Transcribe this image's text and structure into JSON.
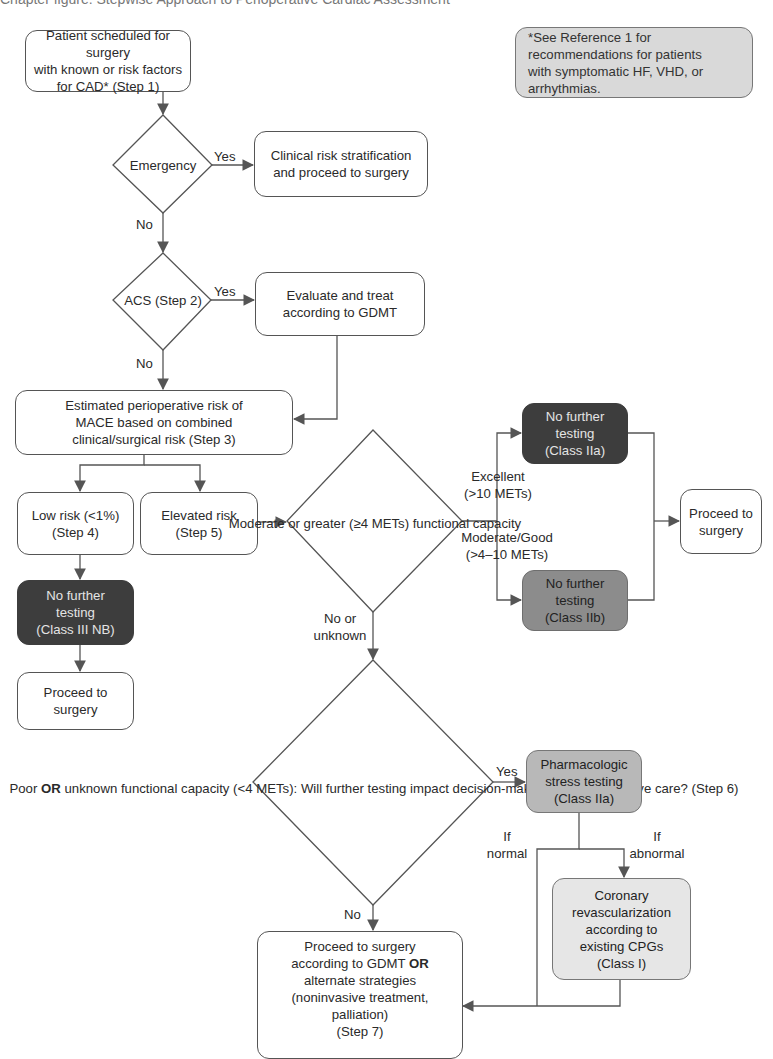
{
  "header_clip": "Chapter figure: Stepwise Approach to Perioperative Cardiac Assessment",
  "note": {
    "lines": [
      "*See Reference 1 for",
      "recommendations for patients",
      "with symptomatic HF, VHD, or",
      "arrhythmias."
    ]
  },
  "nodes": {
    "step1": [
      "Patient scheduled for surgery",
      "with known or risk factors",
      "for CAD* (Step 1)"
    ],
    "emergency": [
      "Emergency"
    ],
    "clinical": [
      "Clinical risk stratification",
      "and proceed to surgery"
    ],
    "acs": [
      "ACS",
      "(Step 2)"
    ],
    "evaluate": [
      "Evaluate and treat",
      "according to GDMT"
    ],
    "mace": [
      "Estimated perioperative risk of",
      "MACE based on combined",
      "clinical/surgical risk (Step 3)"
    ],
    "low_risk": [
      "Low risk (<1%)",
      "(Step 4)"
    ],
    "elevated": [
      "Elevated risk",
      "(Step 5)"
    ],
    "no_further_iii": [
      "No further",
      "testing",
      "(Class III NB)"
    ],
    "proceed_left": [
      "Proceed to",
      "surgery"
    ],
    "moderate": [
      "Moderate or greater",
      "(≥4 METs) functional",
      "capacity"
    ],
    "no_further_iia": [
      "No further",
      "testing",
      "(Class IIa)"
    ],
    "no_further_iib": [
      "No further",
      "testing",
      "(Class IIb)"
    ],
    "proceed_right": [
      "Proceed to",
      "surgery"
    ],
    "step6": [
      "Poor ",
      "OR",
      " unknown",
      "functional capacity",
      "(<4 METs):",
      "Will further testing impact",
      "decision-making ",
      "OR",
      "perioperative care?",
      "(Step 6)"
    ],
    "pharm": [
      "Pharmacologic",
      "stress testing",
      "(Class IIa)"
    ],
    "coronary": [
      "Coronary",
      "revascularization",
      "according to",
      "existing CPGs",
      "(Class I)"
    ],
    "step7": [
      "Proceed to surgery",
      "according to GDMT ",
      "OR",
      "alternate strategies",
      "(noninvasive treatment,",
      "palliation)",
      "(Step 7)"
    ]
  },
  "labels": {
    "emergency_yes": "Yes",
    "emergency_no": "No",
    "acs_yes": "Yes",
    "acs_no": "No",
    "excellent": [
      "Excellent",
      "(>10 METs)"
    ],
    "moderate_good": [
      "Moderate/Good",
      "(>4–10 METs)"
    ],
    "no_or_unknown": [
      "No or",
      "unknown"
    ],
    "step6_yes": "Yes",
    "step6_no": "No",
    "if_normal": [
      "If",
      "normal"
    ],
    "if_abnormal": [
      "If",
      "abnormal"
    ]
  },
  "colors": {
    "line": "#555555",
    "dark_box": "#3d3d3d",
    "mid_box": "#8c8c8c",
    "light_box": "#b8b8b8",
    "pale_box": "#e6e6e6",
    "note_box": "#d9d9d9"
  }
}
